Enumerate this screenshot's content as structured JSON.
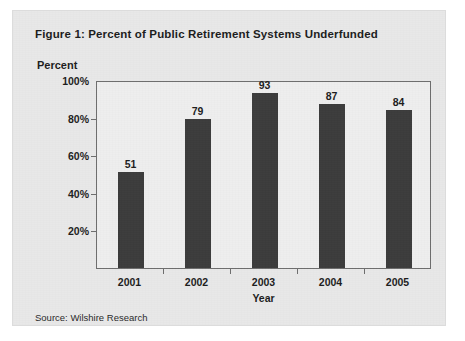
{
  "figure": {
    "title": "Figure 1: Percent of Public Retirement Systems Underfunded",
    "source": "Source: Wilshire Research",
    "panel_background": "#e8e8e8",
    "plot_background": "#eeeeee",
    "bar_color": "#3c3c3c",
    "axis_color": "#6e6e6e",
    "text_color": "#1d1d1d"
  },
  "chart_data": {
    "type": "bar",
    "title": "Figure 1: Percent of Public Retirement Systems Underfunded",
    "subtitle": "",
    "xlabel": "Year",
    "ylabel": "Percent",
    "categories": [
      "2001",
      "2002",
      "2003",
      "2004",
      "2005"
    ],
    "values": [
      51,
      79,
      93,
      87,
      84
    ],
    "value_labels": [
      "51",
      "79",
      "93",
      "87",
      "84"
    ],
    "ylim": [
      0,
      100
    ],
    "yticks": [
      20,
      40,
      60,
      80,
      100
    ],
    "ytick_labels": [
      "20%",
      "40%",
      "60%",
      "80%",
      "100%"
    ],
    "grid": false,
    "legend": false,
    "legend_position": "none",
    "annotations": [
      "Source: Wilshire Research"
    ]
  }
}
